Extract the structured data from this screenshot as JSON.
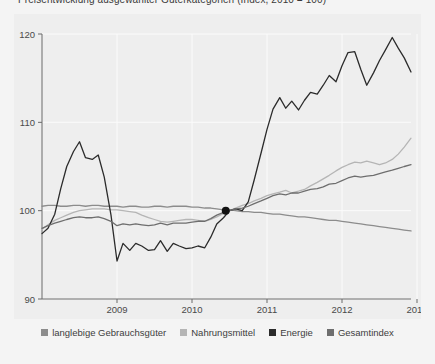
{
  "chart_data": {
    "type": "line",
    "title": "Preisentwicklung ausgewählter Güterkategorien (Index, 2010 = 100)",
    "xlabel": "",
    "ylabel": "",
    "xlim": [
      2008.0,
      2012.92
    ],
    "ylim": [
      90,
      120
    ],
    "x_tick_labels": [
      "2009",
      "2010",
      "2011",
      "2012",
      "2013"
    ],
    "x_ticks": [
      2009,
      2010,
      2011,
      2012,
      2013
    ],
    "y_tick_labels": [
      "90",
      "100",
      "110",
      "120"
    ],
    "y_ticks": [
      90,
      100,
      110,
      120
    ],
    "grid": true,
    "legend_position": "bottom",
    "marker_point": {
      "x": 2010.45,
      "y": 100.0,
      "label": ""
    },
    "series": [
      {
        "name": "langlebige Gebrauchsgüter",
        "color": "#8c8c8c",
        "x": [
          2008.0,
          2008.08,
          2008.17,
          2008.25,
          2008.33,
          2008.42,
          2008.5,
          2008.58,
          2008.67,
          2008.75,
          2008.83,
          2008.92,
          2009.0,
          2009.08,
          2009.17,
          2009.25,
          2009.33,
          2009.42,
          2009.5,
          2009.58,
          2009.67,
          2009.75,
          2009.83,
          2009.92,
          2010.0,
          2010.08,
          2010.17,
          2010.25,
          2010.33,
          2010.42,
          2010.5,
          2010.58,
          2010.67,
          2010.75,
          2010.83,
          2010.92,
          2011.0,
          2011.08,
          2011.17,
          2011.25,
          2011.33,
          2011.42,
          2011.5,
          2011.58,
          2011.67,
          2011.75,
          2011.83,
          2011.92,
          2012.0,
          2012.08,
          2012.17,
          2012.25,
          2012.33,
          2012.42,
          2012.5,
          2012.58,
          2012.67,
          2012.75,
          2012.83,
          2012.92
        ],
        "values": [
          100.5,
          100.6,
          100.6,
          100.5,
          100.5,
          100.6,
          100.6,
          100.5,
          100.6,
          100.6,
          100.5,
          100.5,
          100.5,
          100.4,
          100.5,
          100.5,
          100.4,
          100.4,
          100.5,
          100.5,
          100.4,
          100.5,
          100.5,
          100.5,
          100.4,
          100.4,
          100.3,
          100.3,
          100.2,
          100.1,
          100.1,
          100.0,
          99.9,
          99.9,
          99.8,
          99.8,
          99.7,
          99.6,
          99.6,
          99.5,
          99.4,
          99.3,
          99.3,
          99.2,
          99.1,
          99.0,
          98.9,
          98.9,
          98.8,
          98.7,
          98.6,
          98.5,
          98.4,
          98.3,
          98.2,
          98.1,
          98.0,
          97.9,
          97.8,
          97.7
        ]
      },
      {
        "name": "Nahrungsmittel",
        "color": "#b5b5b5",
        "x": [
          2008.0,
          2008.08,
          2008.17,
          2008.25,
          2008.33,
          2008.42,
          2008.5,
          2008.58,
          2008.67,
          2008.75,
          2008.83,
          2008.92,
          2009.0,
          2009.08,
          2009.17,
          2009.25,
          2009.33,
          2009.42,
          2009.5,
          2009.58,
          2009.67,
          2009.75,
          2009.83,
          2009.92,
          2010.0,
          2010.08,
          2010.17,
          2010.25,
          2010.33,
          2010.42,
          2010.5,
          2010.58,
          2010.67,
          2010.75,
          2010.83,
          2010.92,
          2011.0,
          2011.08,
          2011.17,
          2011.25,
          2011.33,
          2011.42,
          2011.5,
          2011.58,
          2011.67,
          2011.75,
          2011.83,
          2011.92,
          2012.0,
          2012.08,
          2012.17,
          2012.25,
          2012.33,
          2012.42,
          2012.5,
          2012.58,
          2012.67,
          2012.75,
          2012.83,
          2012.92
        ],
        "values": [
          97.9,
          98.4,
          98.9,
          99.2,
          99.5,
          99.8,
          100.0,
          100.1,
          100.2,
          100.2,
          100.2,
          100.1,
          100.1,
          100.0,
          99.9,
          99.8,
          99.5,
          99.2,
          99.0,
          98.8,
          98.7,
          98.8,
          98.9,
          99.0,
          99.0,
          98.9,
          98.8,
          99.0,
          99.3,
          99.7,
          100.0,
          100.3,
          100.6,
          100.8,
          101.1,
          101.4,
          101.7,
          101.9,
          102.1,
          102.3,
          102.0,
          102.2,
          102.4,
          102.8,
          103.2,
          103.6,
          104.0,
          104.5,
          104.9,
          105.2,
          105.5,
          105.4,
          105.6,
          105.4,
          105.2,
          105.4,
          105.8,
          106.4,
          107.2,
          108.2
        ]
      },
      {
        "name": "Energie",
        "color": "#2b2b2b",
        "x": [
          2008.0,
          2008.08,
          2008.17,
          2008.25,
          2008.33,
          2008.42,
          2008.5,
          2008.58,
          2008.67,
          2008.75,
          2008.83,
          2008.92,
          2009.0,
          2009.08,
          2009.17,
          2009.25,
          2009.33,
          2009.42,
          2009.5,
          2009.58,
          2009.67,
          2009.75,
          2009.83,
          2009.92,
          2010.0,
          2010.08,
          2010.17,
          2010.25,
          2010.33,
          2010.42,
          2010.5,
          2010.58,
          2010.67,
          2010.75,
          2010.83,
          2010.92,
          2011.0,
          2011.08,
          2011.17,
          2011.25,
          2011.33,
          2011.42,
          2011.5,
          2011.58,
          2011.67,
          2011.75,
          2011.83,
          2011.92,
          2012.0,
          2012.08,
          2012.17,
          2012.25,
          2012.33,
          2012.42,
          2012.5,
          2012.58,
          2012.67,
          2012.75,
          2012.83,
          2012.92
        ],
        "values": [
          97.4,
          98.0,
          99.6,
          102.5,
          105.0,
          106.7,
          107.8,
          106.0,
          105.8,
          106.3,
          103.8,
          99.5,
          94.3,
          96.3,
          95.5,
          96.3,
          96.0,
          95.5,
          95.6,
          96.6,
          95.4,
          96.3,
          96.0,
          95.7,
          95.8,
          96.0,
          95.8,
          97.0,
          98.5,
          99.2,
          100.0,
          100.2,
          100.0,
          101.0,
          103.5,
          106.5,
          109.2,
          111.5,
          112.8,
          111.6,
          112.4,
          111.4,
          112.5,
          113.4,
          113.2,
          114.2,
          115.3,
          114.6,
          116.4,
          117.9,
          118.0,
          116.0,
          114.2,
          115.6,
          117.0,
          118.2,
          119.6,
          118.4,
          117.3,
          115.7
        ]
      },
      {
        "name": "Gesamtindex",
        "color": "#6e6e6e",
        "x": [
          2008.0,
          2008.08,
          2008.17,
          2008.25,
          2008.33,
          2008.42,
          2008.5,
          2008.58,
          2008.67,
          2008.75,
          2008.83,
          2008.92,
          2009.0,
          2009.08,
          2009.17,
          2009.25,
          2009.33,
          2009.42,
          2009.5,
          2009.58,
          2009.67,
          2009.75,
          2009.83,
          2009.92,
          2010.0,
          2010.08,
          2010.17,
          2010.25,
          2010.33,
          2010.42,
          2010.5,
          2010.58,
          2010.67,
          2010.75,
          2010.83,
          2010.92,
          2011.0,
          2011.08,
          2011.17,
          2011.25,
          2011.33,
          2011.42,
          2011.5,
          2011.58,
          2011.67,
          2011.75,
          2011.83,
          2011.92,
          2012.0,
          2012.08,
          2012.17,
          2012.25,
          2012.33,
          2012.42,
          2012.5,
          2012.58,
          2012.67,
          2012.75,
          2012.83,
          2012.92
        ],
        "values": [
          98.0,
          98.3,
          98.6,
          98.8,
          99.0,
          99.2,
          99.3,
          99.2,
          99.2,
          99.3,
          99.1,
          98.8,
          98.3,
          98.5,
          98.4,
          98.5,
          98.4,
          98.3,
          98.4,
          98.6,
          98.4,
          98.6,
          98.6,
          98.6,
          98.7,
          98.8,
          98.8,
          99.1,
          99.5,
          99.8,
          100.0,
          100.2,
          100.3,
          100.5,
          100.8,
          101.1,
          101.4,
          101.7,
          101.9,
          101.8,
          102.0,
          102.0,
          102.2,
          102.4,
          102.5,
          102.7,
          103.0,
          103.1,
          103.4,
          103.7,
          103.9,
          103.8,
          103.9,
          104.0,
          104.2,
          104.4,
          104.6,
          104.8,
          105.0,
          105.2
        ]
      }
    ]
  },
  "legend": {
    "items": [
      {
        "label": "langlebige Gebrauchsgüter",
        "color": "#8c8c8c"
      },
      {
        "label": "Nahrungsmittel",
        "color": "#b5b5b5"
      },
      {
        "label": "Energie",
        "color": "#2b2b2b"
      },
      {
        "label": "Gesamtindex",
        "color": "#6e6e6e"
      }
    ]
  },
  "colors": {
    "page_background": "#f4f4f4",
    "panel_background": "#eeeeee",
    "gridline": "#fbfbfb",
    "axis": "#6a6a6a",
    "tick_text": "#4a4a4a"
  }
}
